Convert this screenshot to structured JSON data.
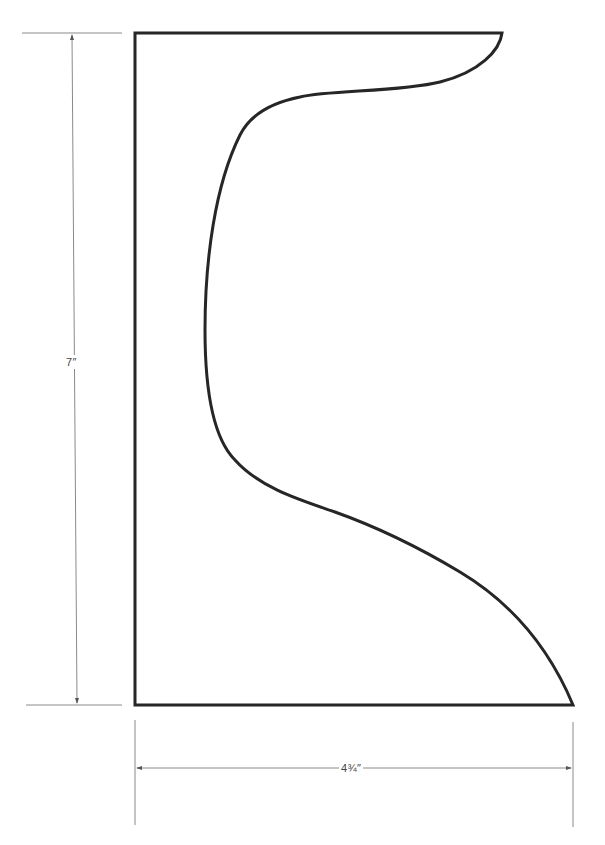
{
  "drawing": {
    "type": "pattern-template",
    "colors": {
      "outline": "#262626",
      "dimension_line": "#888888",
      "background": "#ffffff"
    },
    "outline_path": "M135,33 L502,33 C500,50 480,72 440,82 C400,92 330,90 300,97 C270,103 250,115 240,135 C215,185 205,260 205,330 C205,395 215,440 235,460 C260,488 300,500 335,512 C380,528 420,548 460,572 C515,605 550,650 573,705 L135,705 Z",
    "dimensions": {
      "height": {
        "label": "7″",
        "value_inches": 7
      },
      "width": {
        "label": "4¾″",
        "value_inches": 4.75
      }
    }
  }
}
